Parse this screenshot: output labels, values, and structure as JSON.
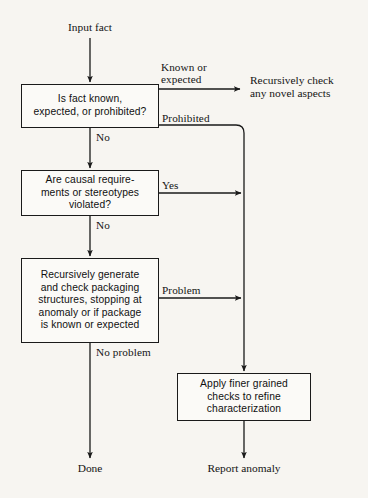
{
  "diagram": {
    "background_color": "#f7f5f1",
    "line_color": "#1a1a1a"
  },
  "terminals": {
    "input": "Input fact",
    "done": "Done",
    "report": "Report anomaly",
    "recursive_check": "Recursively check\nany novel aspects"
  },
  "nodes": [
    {
      "id": "is-fact-known",
      "text": "Is fact known,\nexpected, or prohibited?"
    },
    {
      "id": "causal-requirements",
      "text": "Are causal require-\nments or stereotypes\nviolated?"
    },
    {
      "id": "recursively-generate",
      "text": "Recursively generate\nand check packaging\nstructures, stopping at\nanomaly or if package\nis known or expected"
    },
    {
      "id": "apply-finer-checks",
      "text": "Apply finer grained\nchecks to refine\ncharacterization"
    }
  ],
  "edge_labels": {
    "known_or_expected": "Known or\nexpected",
    "prohibited": "Prohibited",
    "no_1": "No",
    "yes": "Yes",
    "no_2": "No",
    "problem": "Problem",
    "no_problem": "No problem"
  }
}
